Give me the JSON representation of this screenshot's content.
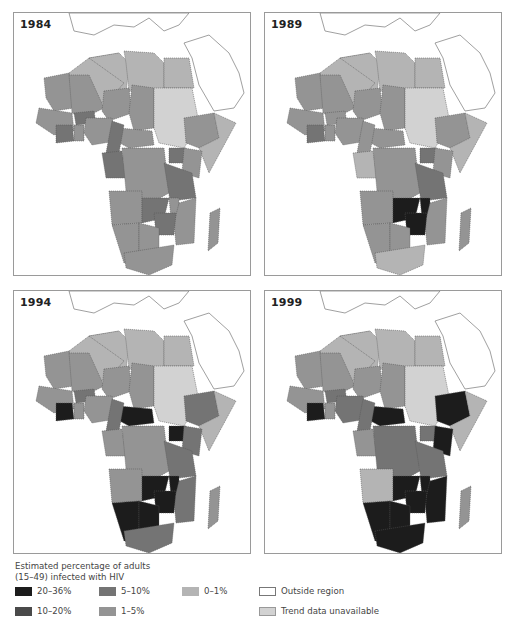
{
  "figure": {
    "panels": [
      {
        "year": "1984"
      },
      {
        "year": "1989"
      },
      {
        "year": "1994"
      },
      {
        "year": "1999"
      }
    ],
    "legend": {
      "title_line1": "Estimated percentage of adults",
      "title_line2": "(15–49) infected with HIV",
      "items": [
        {
          "label": "20–36%",
          "color": "#1c1c1c"
        },
        {
          "label": "10–20%",
          "color": "#4a4a4a"
        },
        {
          "label": "5–10%",
          "color": "#747474"
        },
        {
          "label": "1–5%",
          "color": "#949494"
        },
        {
          "label": "0–1%",
          "color": "#b4b4b4"
        },
        {
          "label": "Outside region",
          "color": "#ffffff"
        },
        {
          "label": "Trend data unavailable",
          "color": "#d2d2d2"
        }
      ]
    }
  },
  "chart_data": {
    "type": "choropleth",
    "title": "Estimated percentage of adults (15–49) infected with HIV",
    "categories": [
      "20–36%",
      "10–20%",
      "5–10%",
      "1–5%",
      "0–1%",
      "Outside region",
      "Trend data unavailable"
    ],
    "maps": [
      {
        "year": "1984",
        "summary": "Mostly 1–5% across sub-Saharan Africa; 5–10% in Burkina Faso, Côte d'Ivoire, Cameroon, Congo, Uganda, Tanzania, Zambia, Zimbabwe; North Africa and Sudan 0–1%/trend unavailable"
      },
      {
        "year": "1989",
        "summary": "20–36% in Zambia, Zimbabwe and Malawi; 5–10% in Uganda, Tanzania, Côte d'Ivoire; most other sub-Saharan countries 1–5%"
      },
      {
        "year": "1994",
        "summary": "20–36% in Côte d'Ivoire, Central African Republic, Uganda, Malawi, Zambia, Zimbabwe, Botswana, Namibia; 5–10% in Kenya, Tanzania, Mozambique, South Africa and much of west-central Africa"
      },
      {
        "year": "1999",
        "summary": "20–36% across southern Africa (South Africa, Namibia, Botswana, Zimbabwe, Zambia, Mozambique, Malawi), Ethiopia, Kenya, Côte d'Ivoire, Central African Republic; Angola 0–1%; North Africa and Sudan lowest"
      }
    ]
  }
}
